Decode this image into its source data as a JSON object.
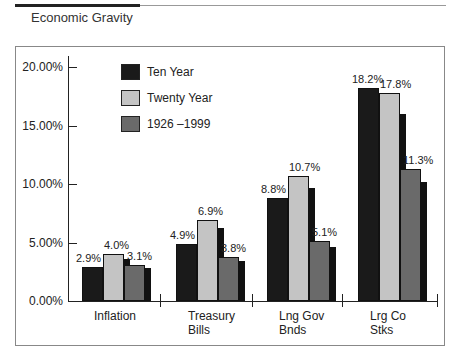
{
  "header": {
    "title": "Economic Gravity"
  },
  "colors": {
    "ten_year": "#1a1a1a",
    "twenty_year": "#c4c4c4",
    "long_run": "#6a6a6a",
    "shadow": "#111111"
  },
  "legend": [
    {
      "label": "Ten Year",
      "color": "#1a1a1a"
    },
    {
      "label": "Twenty Year",
      "color": "#c4c4c4"
    },
    {
      "label": "1926 –1999",
      "color": "#6a6a6a"
    }
  ],
  "chart_data": {
    "type": "bar",
    "title": "Economic Gravity",
    "xlabel": "",
    "ylabel": "",
    "ylim": [
      0,
      20
    ],
    "yticks": [
      "0.00%",
      "5.00%",
      "10.00%",
      "15.00%",
      "20.00%"
    ],
    "categories": [
      "Inflation",
      "Treasury Bills",
      "Lng Gov Bnds",
      "Lrg Co Stks"
    ],
    "series": [
      {
        "name": "Ten Year",
        "values": [
          2.9,
          4.9,
          8.8,
          18.2
        ],
        "labels": [
          "2.9%",
          "4.9%",
          "8.8%",
          "18.2%"
        ]
      },
      {
        "name": "Twenty Year",
        "values": [
          4.0,
          6.9,
          10.7,
          17.8
        ],
        "labels": [
          "4.0%",
          "6.9%",
          "10.7%",
          "17.8%"
        ]
      },
      {
        "name": "1926 –1999",
        "values": [
          3.1,
          3.8,
          5.1,
          11.3
        ],
        "labels": [
          "3.1%",
          "3.8%",
          "5.1%",
          "11.3%"
        ]
      }
    ],
    "legend_position": "upper-left",
    "grid": false
  },
  "xaxis": {
    "labels": [
      [
        "Inflation",
        ""
      ],
      [
        "Treasury",
        "Bills"
      ],
      [
        "Lng Gov",
        "Bnds"
      ],
      [
        "Lrg Co",
        "Stks"
      ]
    ]
  }
}
